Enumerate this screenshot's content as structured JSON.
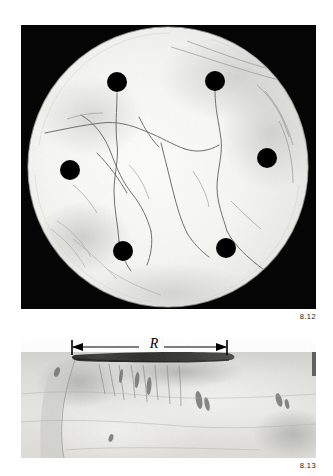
{
  "page": {
    "background_color": "#ffffff",
    "width": 333,
    "height": 476
  },
  "figures": [
    {
      "id": "figure-8-12",
      "caption": "8.12",
      "subject": "dark-field photograph of a circular ceramic disc specimen with six drilled holes and radial surface cracks",
      "panel": {
        "background_color": "#050505",
        "x": 21,
        "y": 25,
        "width": 295,
        "height": 284
      },
      "disc": {
        "center_x": 147,
        "center_y": 142,
        "radius": 140,
        "fill_color": "#f2f2f0"
      },
      "holes": [
        {
          "label": "hole-top-left",
          "cx": 96,
          "cy": 57,
          "r": 10
        },
        {
          "label": "hole-top-right",
          "cx": 194,
          "cy": 56,
          "r": 10
        },
        {
          "label": "hole-mid-left",
          "cx": 49,
          "cy": 145,
          "r": 10
        },
        {
          "label": "hole-mid-right",
          "cx": 246,
          "cy": 133,
          "r": 10
        },
        {
          "label": "hole-bottom-left",
          "cx": 102,
          "cy": 226,
          "r": 10
        },
        {
          "label": "hole-bottom-right",
          "cx": 205,
          "cy": 223,
          "r": 10
        }
      ],
      "hole_color": "#000000",
      "crack_color": "#5a5a5a"
    },
    {
      "id": "figure-8-13",
      "caption": "8.13",
      "subject": "cross-sectional micrograph of the fractured specimen showing the crack length R measured along the top surface",
      "panel": {
        "background_color": "#d8d8d4",
        "x": 21,
        "y": 338,
        "width": 295,
        "height": 120
      },
      "dimension": {
        "symbol": "R",
        "label_x": 152,
        "line_y": 347,
        "left_x": 72,
        "right_x": 227,
        "line_color": "#000000"
      },
      "dark_band": {
        "x_start": 75,
        "x_end": 226,
        "y": 355,
        "color": "#2a2a28"
      }
    }
  ]
}
